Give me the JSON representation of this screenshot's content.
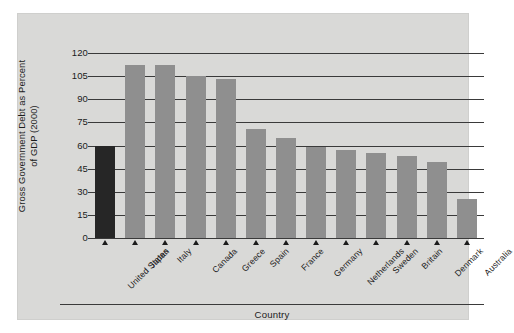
{
  "chart_data": {
    "type": "bar",
    "title": "",
    "xlabel": "Country",
    "ylabel": "Gross Government Debt as Percent of GDP (2000)",
    "ylabel_line1": "Gross Government Debt as Percent",
    "ylabel_line2": "of GDP (2000)",
    "categories": [
      "United States",
      "Japan",
      "Italy",
      "Canada",
      "Greece",
      "Spain",
      "France",
      "Germany",
      "Netherlands",
      "Sweden",
      "Britain",
      "Denmark",
      "Australia"
    ],
    "values": [
      60,
      112,
      112,
      105,
      103,
      71,
      65,
      59,
      57,
      55,
      53,
      49,
      25
    ],
    "ylim": [
      0,
      120
    ],
    "yticks": [
      0,
      15,
      30,
      45,
      60,
      75,
      90,
      105,
      120
    ],
    "ytick_labels": [
      "0",
      "15",
      "30",
      "45",
      "60",
      "75",
      "90",
      "105",
      "120"
    ],
    "grid": true,
    "legend": "none",
    "highlight_index": 0,
    "colors": {
      "bar": "#8f8f8f",
      "bar_highlight": "#262626",
      "panel_background": "#d9d9d7",
      "figure_background": "#ffffff",
      "axis": "#3a3a3a",
      "text": "#1b1b1b"
    }
  }
}
